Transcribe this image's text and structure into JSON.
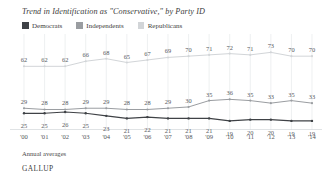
{
  "chart_data": {
    "type": "line",
    "title": "Trend in Identification as \"Conservative,\" by Party ID",
    "xlabel": "",
    "ylabel": "",
    "ylim": [
      15,
      78
    ],
    "grid": true,
    "grid_axis": "x",
    "legend_position": "top-left",
    "categories": [
      "'00",
      "'01",
      "'02",
      "'03",
      "'04",
      "'05",
      "'06",
      "'07",
      "'08",
      "'09",
      "'10",
      "'11",
      "'12",
      "'13",
      "'14"
    ],
    "series": [
      {
        "name": "Democrats",
        "color": "#3f4246",
        "values": [
          25,
          25,
          26,
          25,
          23,
          21,
          22,
          21,
          21,
          21,
          19,
          20,
          20,
          19,
          19
        ]
      },
      {
        "name": "Independents",
        "color": "#9a9da1",
        "values": [
          29,
          28,
          28,
          29,
          29,
          28,
          28,
          29,
          30,
          35,
          36,
          35,
          33,
          35,
          33
        ]
      },
      {
        "name": "Republicans",
        "color": "#d2d5d8",
        "values": [
          62,
          62,
          62,
          66,
          68,
          65,
          67,
          69,
          70,
          71,
          72,
          71,
          73,
          70,
          70
        ]
      }
    ],
    "footnote": "Annual averages",
    "brand": "GALLUP"
  }
}
